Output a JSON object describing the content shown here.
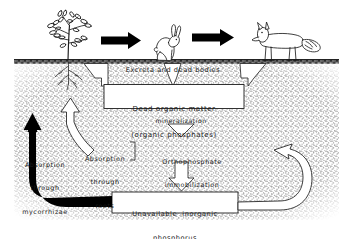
{
  "diagram": {
    "palette": {
      "ink": "#1a1a1a",
      "soil_stipple": "#9a9a9a",
      "paper": "#ffffff",
      "arrow_solid": "#000000",
      "arrow_hollow_fill": "#ffffff"
    },
    "surface_label": "Excreta and dead bodies",
    "boxes": [
      {
        "name": "dead-organic-matter",
        "line1": "Dead organic matter",
        "line2": "(organic phosphates)"
      },
      {
        "name": "unavailable-inorganic-phosphorus",
        "line1": "Unavailable  inorganic",
        "line2": "phosphorus"
      }
    ],
    "process_labels": [
      {
        "name": "mineralization",
        "text": "mineralization"
      },
      {
        "name": "orthophosphate-immobilization",
        "line1": "Orthophosphate",
        "line2": "immobilization"
      },
      {
        "name": "absorption-through-mycorrhizae",
        "line1": "Absorption",
        "line2": "through",
        "line3": "mycorrhizae"
      },
      {
        "name": "absorption-through-roots",
        "line1": "Absorption",
        "line2": "through",
        "line3": "roots"
      }
    ],
    "organisms": [
      {
        "name": "plant",
        "label": "plant"
      },
      {
        "name": "rabbit",
        "label": "rabbit"
      },
      {
        "name": "fox",
        "label": "fox"
      }
    ],
    "flow_arrows": [
      {
        "name": "arrow-plant-to-rabbit",
        "style": "solid-black",
        "direction": "right"
      },
      {
        "name": "arrow-rabbit-to-fox",
        "style": "solid-black",
        "direction": "right"
      },
      {
        "name": "arrow-plant-to-dead-organic-matter",
        "style": "hollow",
        "direction": "down"
      },
      {
        "name": "arrow-rabbit-to-dead-organic-matter",
        "style": "hollow",
        "direction": "down"
      },
      {
        "name": "arrow-fox-to-dead-organic-matter",
        "style": "hollow",
        "direction": "down"
      },
      {
        "name": "arrow-mineralization",
        "style": "hollow",
        "direction": "down"
      },
      {
        "name": "arrow-immobilization",
        "style": "hollow",
        "direction": "down"
      },
      {
        "name": "arrow-absorption-roots",
        "style": "hollow",
        "direction": "up-curved"
      },
      {
        "name": "arrow-absorption-mycorrhizae",
        "style": "solid-black",
        "direction": "up-curved"
      },
      {
        "name": "arrow-weathering-loop",
        "style": "hollow",
        "direction": "loop-left"
      }
    ]
  }
}
